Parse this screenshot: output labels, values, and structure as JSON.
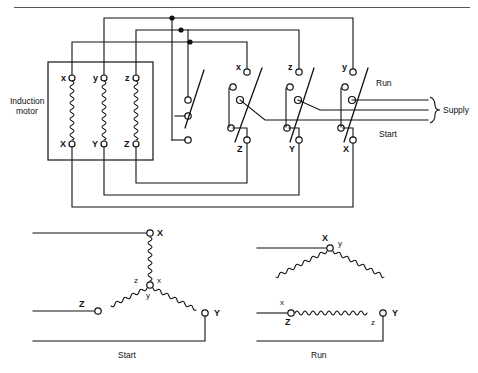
{
  "figure": {
    "type": "schematic-diagram",
    "top_rule": true
  },
  "motor": {
    "label_line1": "Induction",
    "label_line2": "motor",
    "windings": [
      {
        "top_terminal": "x",
        "bottom_terminal": "X"
      },
      {
        "top_terminal": "y",
        "bottom_terminal": "Y"
      },
      {
        "top_terminal": "z",
        "bottom_terminal": "Z"
      }
    ]
  },
  "switchgear": {
    "poles": [
      {
        "name": "pole-1",
        "top_terminal": "",
        "bottom_terminal": ""
      },
      {
        "name": "pole-2",
        "top_terminal": "x",
        "bottom_terminal": "Z"
      },
      {
        "name": "pole-3",
        "top_terminal": "z",
        "bottom_terminal": "Y"
      },
      {
        "name": "pole-4",
        "top_terminal": "y",
        "bottom_terminal": "X"
      }
    ]
  },
  "supply": {
    "run_label": "Run",
    "start_label": "Start",
    "supply_label": "Supply",
    "line_count": 3
  },
  "star_diagram": {
    "caption": "Start",
    "outer_terminals": [
      "X",
      "Z",
      "Y"
    ],
    "centre_terminals": [
      "z",
      "x",
      "y"
    ],
    "connection": "star"
  },
  "delta_diagram": {
    "caption": "Run",
    "corner_top": {
      "outer": "X",
      "inner": "y"
    },
    "corner_left": {
      "outer": "Z",
      "inner": "x"
    },
    "corner_right": {
      "outer": "Y",
      "inner": "z"
    },
    "connection": "delta"
  }
}
